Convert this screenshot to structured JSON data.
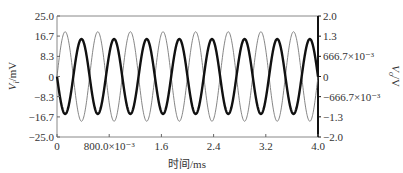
{
  "chart_data": {
    "type": "line",
    "title": "",
    "xlabel": "时间/ms",
    "ylabel_left": "V_i/mV",
    "ylabel_right": "V_o/V",
    "xlim": [
      0,
      4.0
    ],
    "ylim_left": [
      -25.0,
      25.0
    ],
    "ylim_right": [
      -2.0,
      2.0
    ],
    "x_ticks": [
      0,
      0.8,
      1.6,
      2.4,
      3.2,
      4.0
    ],
    "x_tick_labels": [
      "0",
      "800.0×10⁻³",
      "1.6",
      "2.4",
      "3.2",
      "4.0"
    ],
    "y_left_ticks": [
      25.0,
      16.7,
      8.3,
      0,
      -8.3,
      -16.7,
      -25.0
    ],
    "y_left_tick_labels": [
      "25.0",
      "16.7",
      "8.3",
      "0",
      "−8.3",
      "−16.7",
      "−25.0"
    ],
    "y_right_ticks": [
      2.0,
      1.333,
      0.6667,
      0,
      -0.6667,
      -1.333,
      -2.0
    ],
    "y_right_tick_labels": [
      "2.0",
      "1.3",
      "666.7×10⁻³",
      "0",
      "−666.7×10⁻³",
      "−1.3",
      "−2.0"
    ],
    "grid": false,
    "legend": null,
    "series": [
      {
        "name": "V_i (input)",
        "axis": "left",
        "waveform": "sine",
        "amplitude": 18.5,
        "frequency_khz": 2.0,
        "phase_deg": 0,
        "style": "thin",
        "color": "#777777"
      },
      {
        "name": "V_o (output)",
        "axis": "right",
        "waveform": "sine",
        "amplitude": 1.24,
        "frequency_khz": 2.0,
        "phase_deg": 180,
        "style": "thick",
        "color": "#111111"
      }
    ]
  },
  "layout": {
    "plot_left": 57,
    "plot_right": 318,
    "plot_top": 16,
    "plot_bottom": 137
  }
}
